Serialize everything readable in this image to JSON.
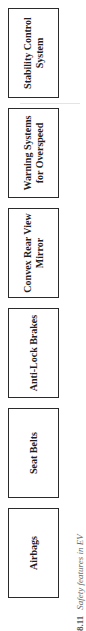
{
  "diagram": {
    "orientation": "rotated-90-ccw",
    "boxes": [
      {
        "label": "Stability Control System"
      },
      {
        "label": "Warning Systems for Overspeed"
      },
      {
        "label": "Convex Rear View Mirror"
      },
      {
        "label": "Anti-Lock Brakes"
      },
      {
        "label": "Seat Belts"
      },
      {
        "label": "Airbags"
      }
    ],
    "caption": {
      "number": "8.11",
      "text": "Safety features in EV"
    }
  }
}
